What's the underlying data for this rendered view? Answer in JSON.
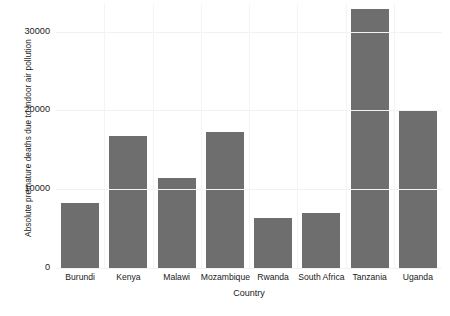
{
  "chart_data": {
    "type": "bar",
    "title": "",
    "xlabel": "Country",
    "ylabel": "Absolute premature deaths due to indoor air pollution",
    "categories": [
      "Burundi",
      "Kenya",
      "Malawi",
      "Mozambique",
      "Rwanda",
      "South Africa",
      "Tanzania",
      "Uganda"
    ],
    "values": [
      8250,
      16750,
      11400,
      17250,
      6400,
      7000,
      32900,
      20000
    ],
    "ylim": [
      0,
      33500
    ],
    "yticks": [
      0,
      10000,
      20000,
      30000
    ],
    "ytick_labels": [
      "0",
      "10000",
      "20000",
      "30000"
    ],
    "grid": true,
    "legend": "none",
    "bar_color": "#6e6e6e",
    "background_color": "#ffffff"
  }
}
